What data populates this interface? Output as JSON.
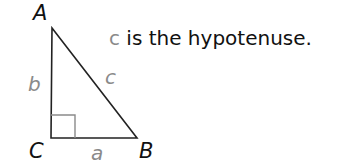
{
  "diagram": {
    "type": "right-triangle",
    "vertices": [
      {
        "label": "A",
        "x": 52,
        "y": 28
      },
      {
        "label": "B",
        "x": 137,
        "y": 138
      },
      {
        "label": "C",
        "x": 51,
        "y": 138
      }
    ],
    "sides": [
      {
        "label": "a",
        "between": "C-B"
      },
      {
        "label": "b",
        "between": "A-C"
      },
      {
        "label": "c",
        "between": "A-B"
      }
    ],
    "right_angle_at": "C",
    "colors": {
      "lines": "#222222",
      "right_angle_mark": "#8a8a8a",
      "side_labels": "#8a8a8a",
      "vertex_labels": "#111111"
    }
  },
  "caption": {
    "variable": "c",
    "text": " is the hypotenuse."
  }
}
